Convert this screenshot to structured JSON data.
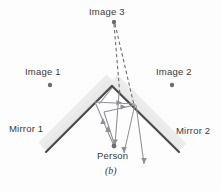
{
  "figure": {
    "caption": "(b)",
    "labels": {
      "image3": "Image 3",
      "image1": "Image 1",
      "image2": "Image 2",
      "mirror1": "Mirror 1",
      "mirror2": "Mirror 2",
      "person": "Person"
    },
    "colors": {
      "background": "#fdfdfd",
      "mirror_line": "#4a4a4a",
      "mirror_shade": "#d9d9d9",
      "ray": "#8f8f96",
      "dashed_ray": "#6e6e74",
      "point": "#6b6b70",
      "text": "#3a3a3a"
    },
    "points": {
      "image3": {
        "x": 114,
        "y": 22
      },
      "image1": {
        "x": 50,
        "y": 85
      },
      "image2": {
        "x": 172,
        "y": 85
      },
      "person": {
        "x": 114,
        "y": 146
      },
      "apex": {
        "x": 112,
        "y": 86
      }
    },
    "mirrors": {
      "mirror1": {
        "x1": 46,
        "y1": 152,
        "x2": 112,
        "y2": 86
      },
      "mirror2": {
        "x1": 112,
        "y1": 86,
        "x2": 179,
        "y2": 152
      }
    },
    "rays": [
      {
        "name": "ray-person-to-mirror1-a",
        "x1": 114,
        "y1": 146,
        "x2": 95,
        "y2": 103,
        "arrow": "mid-up"
      },
      {
        "name": "ray-person-to-mirror1-b",
        "x1": 114,
        "y1": 146,
        "x2": 103,
        "y2": 111,
        "arrow": "mid-up"
      },
      {
        "name": "ray-mirror1-to-mirror2-a",
        "x1": 95,
        "y1": 103,
        "x2": 134,
        "y2": 104,
        "arrow": "mid-right"
      },
      {
        "name": "ray-mirror1-to-mirror2-b",
        "x1": 103,
        "y1": 111,
        "x2": 134,
        "y2": 104,
        "arrow": "mid-right"
      },
      {
        "name": "ray-mirror2-out-a",
        "x1": 134,
        "y1": 104,
        "x2": 124,
        "y2": 152,
        "arrow": "end-down"
      },
      {
        "name": "ray-mirror2-out-b",
        "x1": 134,
        "y1": 104,
        "x2": 143,
        "y2": 163,
        "arrow": "end-down"
      },
      {
        "name": "ray-apex-down",
        "x1": 118,
        "y1": 92,
        "x2": 114,
        "y2": 146,
        "arrow": "none"
      }
    ],
    "dashed_rays": [
      {
        "name": "virtual-ray-left",
        "x1": 114,
        "y1": 22,
        "x2": 120,
        "y2": 95
      },
      {
        "name": "virtual-ray-right",
        "x1": 114,
        "y1": 22,
        "x2": 134,
        "y2": 104
      }
    ]
  }
}
